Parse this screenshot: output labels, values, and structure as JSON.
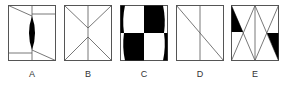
{
  "figures": [
    {
      "label": "A",
      "left": 8
    },
    {
      "label": "B",
      "left": 64
    },
    {
      "label": "C",
      "left": 120
    },
    {
      "label": "D",
      "left": 176
    },
    {
      "label": "E",
      "left": 231
    }
  ],
  "colors": {
    "stroke": "#555555",
    "fill": "#000000",
    "background": "#ffffff"
  }
}
